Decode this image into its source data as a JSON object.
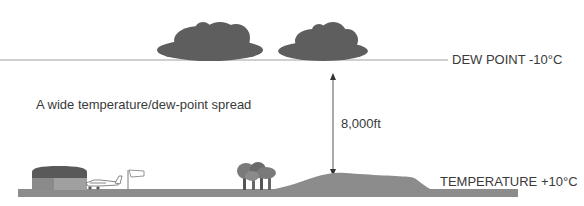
{
  "diagram": {
    "dew_point_label": "DEW POINT -10°C",
    "temperature_label": "TEMPERATURE +10°C",
    "spread_caption": "A wide temperature/dew-point spread",
    "height_label": "8,000ft",
    "icons": [
      "cloud-icon",
      "cloud-icon",
      "hangar-icon",
      "airplane-icon",
      "windsock-icon",
      "trees-icon",
      "hill-icon"
    ]
  },
  "colors": {
    "cloud": "#5e5e5e",
    "ground": "#8c8c8c",
    "hangar_roof": "#5a5a5a",
    "hangar_wall": "#9a9a9a",
    "line": "#9a9a9a",
    "text": "#3a3a3a"
  }
}
